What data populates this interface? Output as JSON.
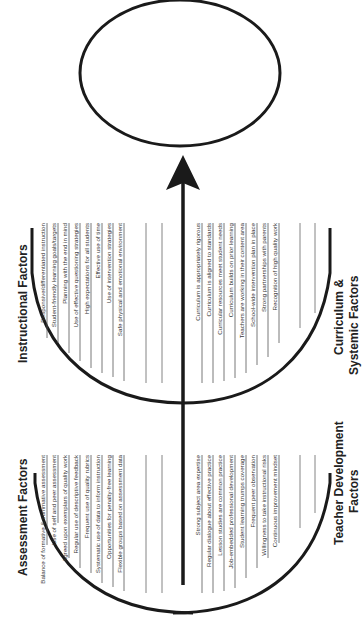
{
  "diagram": {
    "orientation": "rotated 90 degrees counterclockwise",
    "goal_ellipse_label": "",
    "colors": {
      "stroke": "#1a1a1a",
      "text": "#333333",
      "background": "#ffffff"
    },
    "groups": {
      "assessment": {
        "title": "Assessment Factors",
        "items": [
          "Balance of formative & summative assessment",
          "Use of self and peer assessment",
          "Agreed upon exemplars of quality work",
          "Regular use of descriptive feedback",
          "Frequent use of quality rubrics",
          "Systematic use of data to inform instruction",
          "Opportunities for penalty-free learning",
          "Flexible groups based on assessment data"
        ],
        "blank_lines": 2
      },
      "instructional": {
        "title": "Instructional Factors",
        "items": [
          "Responsive/differentiated instruction",
          "Student-friendly learning goals/targets",
          "Planning with the end in mind",
          "Use of effective questioning strategies",
          "High expectations for all students",
          "Effective use of time",
          "Use of intervention strategies",
          "Safe physical and emotional environment"
        ],
        "blank_lines": 2
      },
      "teacher_development": {
        "title_line1": "Teacher Development",
        "title_line2": "Factors",
        "items": [
          "Strong subject area expertise",
          "Regular dialogue about effective practice",
          "Lesson studies are common practice",
          "Job-embedded professional development",
          "Student learning trumps coverage",
          "Frequent peer observation",
          "Willingness to take instructional risks",
          "Continuous improvement mindset"
        ],
        "blank_lines": 2
      },
      "curriculum_systemic": {
        "title_line1": "Curriculum &",
        "title_line2": "Systemic Factors",
        "items": [
          "Curriculum is appropriately rigorous",
          "Curriculum is aligned to standards",
          "Curricular resources meet student needs",
          "Curriculum builds on prior learning",
          "Teachers are working in their content area",
          "School-wide intervention plan in place",
          "Strong partnerships with parents",
          "Recognition of high quality work"
        ],
        "blank_lines": 2
      }
    }
  }
}
